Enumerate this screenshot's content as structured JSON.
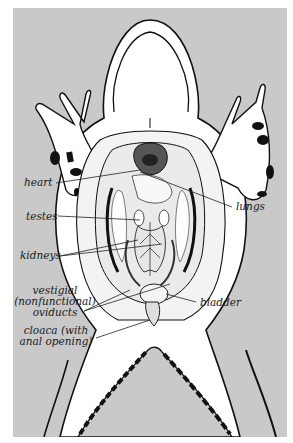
{
  "figure": {
    "background_color": "#c9c9c9",
    "body_color": "#ffffff",
    "outline_color": "#111111"
  },
  "labels": {
    "heart": "heart",
    "lungs": "lungs",
    "testes": "testes",
    "kidneys": "kidneys",
    "vestigial_line1": "vestigial",
    "vestigial_line2": "(nonfunctional)",
    "vestigial_line3": "oviducts",
    "bladder": "bladder",
    "cloaca_line1": "cloaca (with",
    "cloaca_line2": "anal opening)"
  }
}
